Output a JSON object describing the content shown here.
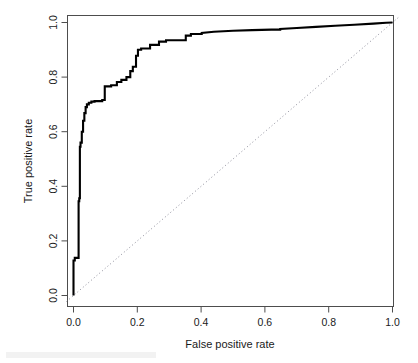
{
  "figure": {
    "background_color": "#ffffff",
    "curve_color": "#000000",
    "diagonal_color": "#8c8c99",
    "frame_color": "#4d4d4d",
    "text_color": "#1a1a1a"
  },
  "axes": {
    "x_title": "False positive rate",
    "y_title": "True positive rate",
    "x_ticks": [
      "0.0",
      "0.2",
      "0.4",
      "0.6",
      "0.8",
      "1.0"
    ],
    "y_ticks": [
      "0.0",
      "0.2",
      "0.4",
      "0.6",
      "0.8",
      "1.0"
    ]
  },
  "chart_data": {
    "type": "line",
    "title": "",
    "xlabel": "False positive rate",
    "ylabel": "True positive rate",
    "xlim": [
      0.0,
      1.0
    ],
    "ylim": [
      0.0,
      1.0
    ],
    "grid": false,
    "legend": "none",
    "xticks": [
      0.0,
      0.2,
      0.4,
      0.6,
      0.8,
      1.0
    ],
    "yticks": [
      0.0,
      0.2,
      0.4,
      0.6,
      0.8,
      1.0
    ],
    "series": [
      {
        "name": "ROC curve",
        "style": "solid",
        "color": "#000000",
        "x": [
          0.0,
          0.0,
          0.004,
          0.004,
          0.016,
          0.016,
          0.018,
          0.018,
          0.02,
          0.02,
          0.022,
          0.022,
          0.026,
          0.026,
          0.03,
          0.03,
          0.034,
          0.034,
          0.038,
          0.038,
          0.042,
          0.042,
          0.048,
          0.048,
          0.056,
          0.056,
          0.066,
          0.066,
          0.09,
          0.09,
          0.098,
          0.098,
          0.118,
          0.118,
          0.136,
          0.136,
          0.15,
          0.15,
          0.166,
          0.166,
          0.178,
          0.178,
          0.186,
          0.186,
          0.196,
          0.196,
          0.202,
          0.202,
          0.212,
          0.212,
          0.24,
          0.24,
          0.268,
          0.268,
          0.29,
          0.29,
          0.352,
          0.352,
          0.368,
          0.368,
          0.402,
          0.402,
          0.44,
          0.47,
          0.5,
          0.56,
          0.62,
          0.648,
          0.648,
          0.7,
          0.76,
          0.82,
          0.88,
          0.94,
          0.98,
          1.0,
          1.0
        ],
        "y": [
          0.0,
          0.128,
          0.128,
          0.138,
          0.138,
          0.345,
          0.345,
          0.356,
          0.356,
          0.545,
          0.545,
          0.56,
          0.56,
          0.6,
          0.6,
          0.64,
          0.64,
          0.668,
          0.668,
          0.69,
          0.69,
          0.7,
          0.7,
          0.706,
          0.706,
          0.71,
          0.71,
          0.712,
          0.712,
          0.716,
          0.716,
          0.766,
          0.766,
          0.77,
          0.77,
          0.782,
          0.782,
          0.79,
          0.79,
          0.8,
          0.8,
          0.822,
          0.822,
          0.838,
          0.838,
          0.878,
          0.878,
          0.9,
          0.9,
          0.905,
          0.905,
          0.918,
          0.918,
          0.93,
          0.93,
          0.935,
          0.935,
          0.952,
          0.952,
          0.958,
          0.958,
          0.962,
          0.966,
          0.968,
          0.97,
          0.972,
          0.974,
          0.974,
          0.976,
          0.98,
          0.984,
          0.988,
          0.992,
          0.996,
          0.999,
          1.0,
          1.0
        ]
      },
      {
        "name": "Chance diagonal",
        "style": "dotted",
        "color": "#8c8c99",
        "x": [
          0.0,
          1.0
        ],
        "y": [
          0.0,
          1.0
        ]
      }
    ]
  }
}
